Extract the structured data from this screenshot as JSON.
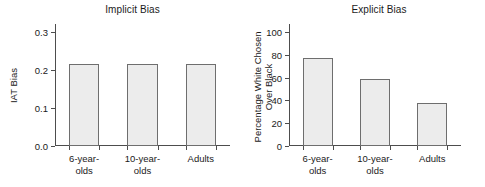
{
  "chart_data": [
    {
      "type": "bar",
      "title": "Implicit Bias",
      "xlabel": "",
      "ylabel": "IAT Bias",
      "categories": [
        "6-year-olds",
        "10-year-olds",
        "Adults"
      ],
      "category_lines": [
        [
          "6-year-",
          "olds"
        ],
        [
          "10-year-",
          "olds"
        ],
        [
          "Adults"
        ]
      ],
      "values": [
        0.215,
        0.215,
        0.215
      ],
      "ylim": [
        0.0,
        0.32
      ],
      "yticks": [
        0.0,
        0.1,
        0.2,
        0.3
      ],
      "ytick_labels": [
        "0.0",
        "0.1",
        "0.2",
        "0.3"
      ],
      "grid": false,
      "legend": "none",
      "bar_fill": "#ececec",
      "bar_border": "#6e6e6e"
    },
    {
      "type": "bar",
      "title": "Explicit Bias",
      "xlabel": "",
      "ylabel": "Percentage White Chosen Over Black",
      "ylabel_lines": [
        "Percentage White Chosen",
        "Over Black"
      ],
      "categories": [
        "6-year-olds",
        "10-year-olds",
        "Adults"
      ],
      "category_lines": [
        [
          "6-year-",
          "olds"
        ],
        [
          "10-year-",
          "olds"
        ],
        [
          "Adults"
        ]
      ],
      "values": [
        77,
        59,
        38
      ],
      "ylim": [
        0,
        107
      ],
      "yticks": [
        0,
        20,
        40,
        60,
        80,
        100
      ],
      "ytick_labels": [
        "0",
        "20",
        "40",
        "60",
        "80",
        "100"
      ],
      "grid": false,
      "legend": "none",
      "bar_fill": "#ececec",
      "bar_border": "#6e6e6e"
    }
  ]
}
